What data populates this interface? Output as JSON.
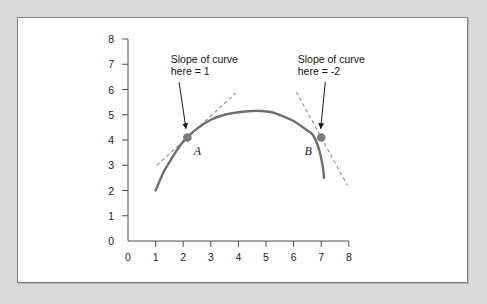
{
  "figure": {
    "background_color": "#d9d9d9",
    "panel_color": "#ffffff",
    "border_color": "#808080"
  },
  "chart_data": {
    "type": "line",
    "title": "",
    "xlabel": "",
    "ylabel": "",
    "xlim": [
      0,
      8
    ],
    "ylim": [
      0,
      8
    ],
    "grid": false,
    "legend": false,
    "curve_color": "#6e6e6e",
    "tangent_color": "#8a8a8a",
    "marker_color": "#7a7a7a",
    "x_ticks": [
      "0",
      "1",
      "2",
      "3",
      "4",
      "5",
      "6",
      "7",
      "8"
    ],
    "y_ticks": [
      "0",
      "1",
      "2",
      "3",
      "4",
      "5",
      "6",
      "7",
      "8"
    ],
    "series": [
      {
        "name": "curve",
        "x": [
          1.0,
          1.3,
          1.6,
          1.9,
          2.15,
          2.5,
          3.0,
          3.5,
          4.0,
          4.5,
          4.8,
          5.2,
          5.6,
          6.0,
          6.4,
          6.7,
          6.9,
          7.05,
          7.1
        ],
        "y": [
          2.0,
          2.75,
          3.3,
          3.8,
          4.1,
          4.45,
          4.8,
          5.0,
          5.1,
          5.15,
          5.15,
          5.1,
          4.95,
          4.75,
          4.45,
          4.2,
          3.7,
          3.0,
          2.5
        ]
      }
    ],
    "points": [
      {
        "label": "A",
        "x": 2.15,
        "y": 4.1,
        "slope": 1,
        "tangent_x_start": 1.05,
        "tangent_x_end": 3.9
      },
      {
        "label": "B",
        "x": 7.0,
        "y": 4.1,
        "slope": -2,
        "tangent_x_start": 6.1,
        "tangent_x_end": 7.95
      }
    ],
    "annotations": [
      {
        "id": "annotation-a",
        "line1": "Slope of curve",
        "line2": "here = 1",
        "text_x": 1.55,
        "text_y": 7.05,
        "arrow_from_x": 1.85,
        "arrow_from_y": 6.3,
        "arrow_to_x": 2.1,
        "arrow_to_y": 4.45
      },
      {
        "id": "annotation-b",
        "line1": "Slope of curve",
        "line2": "here = -2",
        "text_x": 6.15,
        "text_y": 7.05,
        "arrow_from_x": 7.15,
        "arrow_from_y": 6.3,
        "arrow_to_x": 6.98,
        "arrow_to_y": 4.45
      }
    ]
  }
}
